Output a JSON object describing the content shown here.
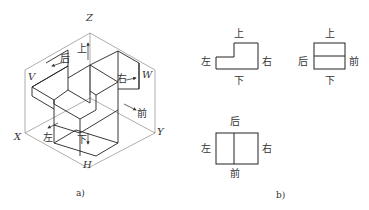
{
  "figure_a": {
    "caption": "a)",
    "axes": {
      "z": "Z",
      "x": "X",
      "y": "Y",
      "v": "V",
      "w": "W",
      "h": "H"
    },
    "direction_labels": {
      "up": "上",
      "back": "后",
      "right": "右",
      "front": "前",
      "left": "左",
      "down": "下"
    }
  },
  "figure_b": {
    "caption": "b)",
    "front_view": {
      "top": "上",
      "left": "左",
      "right": "右",
      "bottom": "下"
    },
    "side_view": {
      "top": "上",
      "left": "后",
      "right": "前",
      "bottom": "下"
    },
    "top_view": {
      "top": "后",
      "left": "左",
      "right": "右",
      "bottom": "前"
    }
  },
  "colors": {
    "line": "#333333",
    "thin_line": "#777777",
    "background": "#ffffff"
  }
}
